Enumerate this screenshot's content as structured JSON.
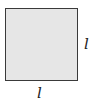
{
  "diagram": {
    "shape": "square",
    "fill_color": "#e6e6e6",
    "border_color": "#3a3a3a",
    "labels": {
      "right_side": "l",
      "bottom_side": "l"
    }
  }
}
